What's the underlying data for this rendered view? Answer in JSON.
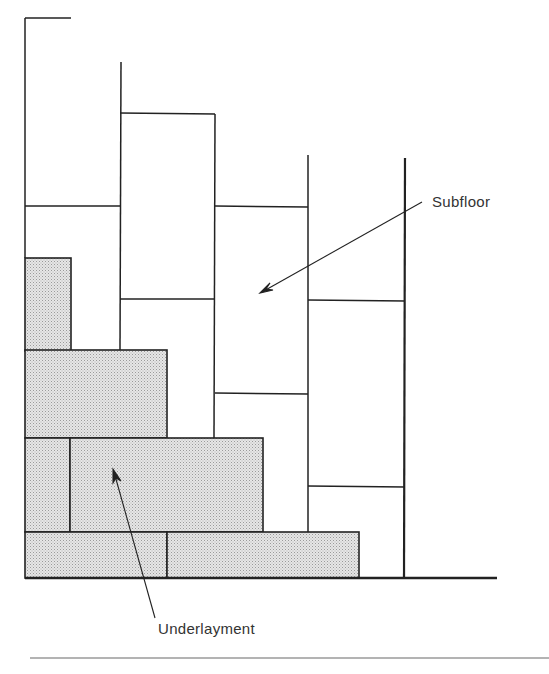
{
  "diagram": {
    "labels": {
      "subfloor": "Subfloor",
      "underlayment": "Underlayment"
    },
    "colors": {
      "line": "#222222",
      "shading": "#d9d9d9",
      "background": "#ffffff",
      "rule": "#999999"
    }
  }
}
